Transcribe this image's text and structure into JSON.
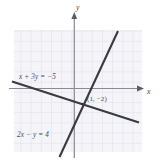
{
  "figure": {
    "kind": "coordinate-graph",
    "axes": {
      "x_label": "x",
      "y_label": "y"
    },
    "equations": [
      {
        "id": "line-shallow",
        "text": "x + 3y = −5"
      },
      {
        "id": "line-steep",
        "text": "2x − y = 4"
      }
    ],
    "intersection": {
      "label": "(1, −2)",
      "x": 1,
      "y": -2
    },
    "colors": {
      "grid": "#dcdce6",
      "grid_background": "#f4f4f9",
      "line": "#3a3a42",
      "axis": "#8a8a94",
      "text": "#4a4a52"
    }
  }
}
